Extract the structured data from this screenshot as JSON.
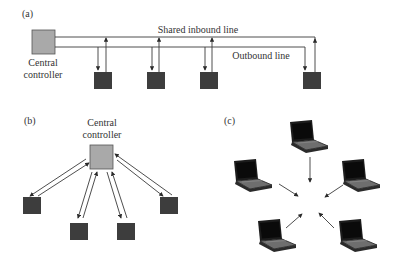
{
  "colors": {
    "controller_fill": "#a9a9a9",
    "node_fill": "#3d3d3d",
    "line": "#3a3a3a",
    "text": "#333333"
  },
  "panel_a": {
    "label": "(a)",
    "inbound_label": "Shared inbound line",
    "outbound_label": "Outbound line",
    "controller_line1": "Central",
    "controller_line2": "controller",
    "node_count": 4
  },
  "panel_b": {
    "label": "(b)",
    "controller_line1": "Central",
    "controller_line2": "controller",
    "node_count": 4
  },
  "panel_c": {
    "label": "(c)",
    "laptop_count": 5
  }
}
